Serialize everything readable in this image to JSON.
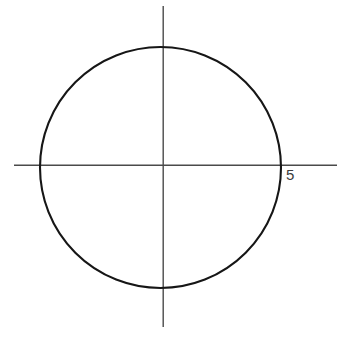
{
  "figure": {
    "background_color": "#ffffff",
    "width": 349,
    "height": 337
  },
  "chart_data": {
    "type": "scatter",
    "title": "",
    "xlabel": "",
    "ylabel": "",
    "grid": false,
    "legend": null,
    "shape": "circle",
    "center": [
      0,
      0
    ],
    "radius_label": "5",
    "radius_value": 5,
    "equation": "x^2 + y^2 = 25",
    "axes": {
      "origin_px": [
        163,
        165
      ],
      "x_axis": {
        "start_px": [
          14,
          165
        ],
        "end_px": [
          337,
          165
        ],
        "color": "#4a4a4a"
      },
      "y_axis": {
        "start_px": [
          163,
          6
        ],
        "end_px": [
          163,
          327
        ],
        "color": "#4a4a4a"
      }
    },
    "circle_px": {
      "cx": 160.5,
      "cy": 167.5,
      "r": 120.5,
      "color": "#161616"
    },
    "annotations": [
      {
        "text": "5",
        "role": "x-intercept-label",
        "data_point": [
          5,
          0
        ],
        "position_px": [
          286,
          176
        ],
        "color": "#3d3d3d"
      }
    ],
    "intercepts": {
      "x": [
        -5,
        5
      ],
      "y": [
        -5,
        5
      ]
    }
  }
}
